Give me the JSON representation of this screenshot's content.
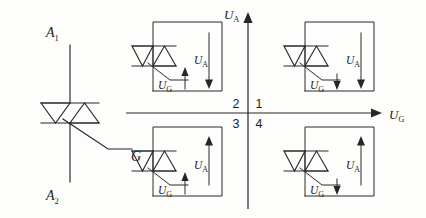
{
  "figure": {
    "type": "triac-trigger-quadrant-diagram",
    "background_color": "#fdfdfc",
    "line_color": "#262626"
  },
  "symbol": {
    "name": "triac-schematic-symbol",
    "terminal_top": "A",
    "terminal_top_sub": "1",
    "terminal_bottom": "A",
    "terminal_bottom_sub": "2",
    "gate": "G"
  },
  "axes": {
    "vertical_label": "U",
    "vertical_sub": "A",
    "horizontal_label": "U",
    "horizontal_sub": "G",
    "vertical_arrow": "up",
    "horizontal_arrow": "right"
  },
  "quadrants": [
    {
      "number": "2",
      "position": "top-left",
      "anode_label": "U",
      "anode_sub": "A",
      "anode_arrow": "down",
      "gate_label": "U",
      "gate_sub": "G",
      "gate_arrow": "up"
    },
    {
      "number": "1",
      "position": "top-right",
      "anode_label": "U",
      "anode_sub": "A",
      "anode_arrow": "down",
      "gate_label": "U",
      "gate_sub": "G",
      "gate_arrow": "down"
    },
    {
      "number": "3",
      "position": "bottom-left",
      "anode_label": "U",
      "anode_sub": "A",
      "anode_arrow": "up",
      "gate_label": "U",
      "gate_sub": "G",
      "gate_arrow": "up"
    },
    {
      "number": "4",
      "position": "bottom-right",
      "anode_label": "U",
      "anode_sub": "A",
      "anode_arrow": "up",
      "gate_label": "U",
      "gate_sub": "G",
      "gate_arrow": "down"
    }
  ]
}
